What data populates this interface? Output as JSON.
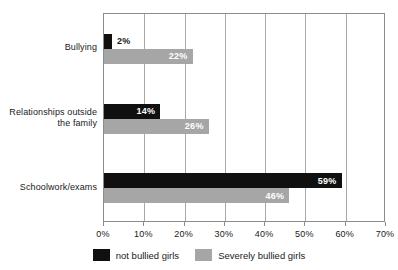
{
  "chart_data": {
    "type": "bar",
    "orientation": "horizontal",
    "title": "",
    "subtitle": "",
    "xlabel": "",
    "ylabel": "",
    "xlim": [
      0,
      70
    ],
    "xticks": [
      "0%",
      "10%",
      "20%",
      "30%",
      "40%",
      "50%",
      "60%",
      "70%"
    ],
    "xtick_values": [
      0,
      10,
      20,
      30,
      40,
      50,
      60,
      70
    ],
    "grid": true,
    "grid_axis": "x",
    "legend_position": "bottom-center",
    "categories": [
      "Bullying",
      "Relationships outside\nthe family",
      "Schoolwork/exams"
    ],
    "series": [
      {
        "name": "not bullied girls",
        "color": "#101010",
        "values": [
          2,
          14,
          59
        ],
        "labels": [
          "2%",
          "14%",
          "59%"
        ]
      },
      {
        "name": "Severely bullied girls",
        "color": "#a6a6a6",
        "values": [
          22,
          26,
          46
        ],
        "labels": [
          "22%",
          "26%",
          "46%"
        ]
      }
    ]
  },
  "legend": {
    "items": [
      {
        "label": "not bullied girls",
        "swatch": "black"
      },
      {
        "label": "Severely bullied girls",
        "swatch": "gray"
      }
    ]
  },
  "colors": {
    "series_black": "#101010",
    "series_gray": "#a6a6a6",
    "axis": "#8c8c8c",
    "gridline": "#a8a8a8",
    "background": "#ffffff",
    "text": "#1a1a1a"
  }
}
